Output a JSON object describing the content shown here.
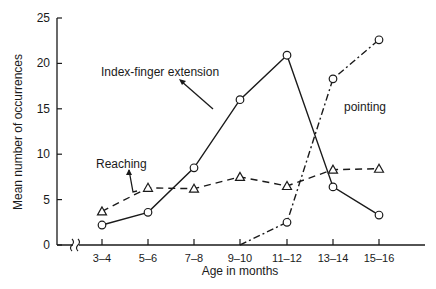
{
  "chart_data": {
    "type": "line",
    "title": "",
    "xlabel": "Age in months",
    "ylabel": "Mean number of occurrences",
    "categories": [
      "3–4",
      "5–6",
      "7–8",
      "9–10",
      "11–12",
      "13–14",
      "15–16"
    ],
    "ylim": [
      0,
      25
    ],
    "yticks": [
      0,
      5,
      10,
      15,
      20,
      25
    ],
    "grid": false,
    "axis_break": true,
    "series": [
      {
        "name": "Index-finger extension",
        "style": "solid",
        "marker": "circle",
        "values": [
          2.2,
          3.6,
          8.5,
          16.0,
          20.9,
          6.4,
          3.3
        ]
      },
      {
        "name": "Reaching",
        "style": "dashed",
        "marker": "triangle",
        "values": [
          3.7,
          6.3,
          6.2,
          7.5,
          6.5,
          8.3,
          8.4
        ]
      },
      {
        "name": "pointing",
        "style": "dash-dot",
        "marker": "circle",
        "values": [
          null,
          null,
          null,
          0.0,
          2.5,
          18.3,
          22.6
        ]
      }
    ],
    "annotations": [
      {
        "text": "Index-finger extension",
        "series": 0
      },
      {
        "text": "Reaching",
        "series": 1
      },
      {
        "text": "pointing",
        "series": 2
      }
    ]
  },
  "labels": {
    "xlabel": "Age in months",
    "ylabel": "Mean number of occurrences",
    "annot_index": "Index-finger extension",
    "annot_reaching": "Reaching",
    "annot_pointing": "pointing"
  }
}
